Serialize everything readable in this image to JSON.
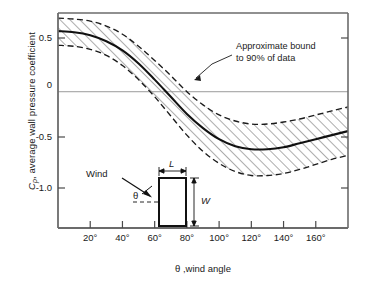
{
  "figure": {
    "axis_label_y_prefix": "C",
    "axis_label_y_sub": "p",
    "axis_label_y_rest": ", average wall pressure coefficient",
    "axis_label_x": "θ ,wind angle",
    "annotation_line1": "Approximate bound",
    "annotation_line2": "to 90% of data",
    "inset": {
      "wind_label": "Wind",
      "theta_label": "θ",
      "length_label": "L",
      "width_label": "W"
    }
  },
  "chart_data": {
    "type": "line",
    "title": "",
    "xlabel": "θ ,wind angle",
    "ylabel": "Cp, average wall pressure coefficient",
    "xlim": [
      0,
      180
    ],
    "ylim": [
      -1.35,
      0.78
    ],
    "grid": false,
    "zero_line": true,
    "legend": "none",
    "xticks": [
      20,
      40,
      60,
      80,
      100,
      120,
      140,
      160
    ],
    "xticklabels": [
      "20°",
      "40°",
      "60°",
      "80°",
      "100°",
      "120°",
      "140°",
      "160°"
    ],
    "yticks": [
      0.5,
      0,
      -0.5,
      -1.0
    ],
    "yticklabels": [
      "0.5",
      "0",
      "-0.5",
      "-1.0"
    ],
    "x": [
      0,
      10,
      20,
      30,
      40,
      50,
      60,
      70,
      80,
      90,
      100,
      110,
      120,
      130,
      140,
      150,
      160,
      170,
      180
    ],
    "series": [
      {
        "name": "mean",
        "style": "solid",
        "values": [
          0.6,
          0.59,
          0.56,
          0.5,
          0.41,
          0.28,
          0.12,
          -0.05,
          -0.22,
          -0.36,
          -0.47,
          -0.54,
          -0.57,
          -0.57,
          -0.55,
          -0.51,
          -0.47,
          -0.43,
          -0.39
        ]
      },
      {
        "name": "upper-bound-90pct",
        "style": "dashed",
        "values": [
          0.73,
          0.72,
          0.7,
          0.65,
          0.57,
          0.45,
          0.31,
          0.16,
          0.0,
          -0.13,
          -0.23,
          -0.29,
          -0.32,
          -0.32,
          -0.3,
          -0.27,
          -0.23,
          -0.19,
          -0.15
        ]
      },
      {
        "name": "lower-bound-90pct",
        "style": "dashed",
        "values": [
          0.46,
          0.45,
          0.42,
          0.36,
          0.26,
          0.12,
          -0.05,
          -0.24,
          -0.43,
          -0.59,
          -0.71,
          -0.79,
          -0.83,
          -0.83,
          -0.81,
          -0.77,
          -0.72,
          -0.67,
          -0.63
        ]
      }
    ],
    "band": {
      "between": [
        "upper-bound-90pct",
        "lower-bound-90pct"
      ],
      "fill": "hatched"
    },
    "annotations": [
      {
        "text": "Approximate bound to 90% of data",
        "points_to_series": "upper-bound-90pct",
        "at_x": 72
      }
    ]
  },
  "colors": {
    "ink": "#1a1a1a",
    "frame": "#6b6b6b",
    "zero_line": "#9a9a9a",
    "hatch": "#4a4a4a"
  }
}
